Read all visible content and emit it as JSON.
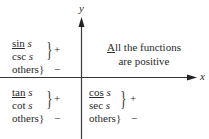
{
  "axes": {
    "x_label": "x",
    "y_label": "y"
  },
  "quadrants": {
    "q2": {
      "rows": [
        {
          "fn": "sin",
          "var": "s",
          "underline_first": true
        },
        {
          "fn": "csc",
          "var": "s"
        },
        {
          "fn": "others",
          "var": ""
        }
      ],
      "positive_sign": "+",
      "negative_sign": "−",
      "brace": "}"
    },
    "q1": {
      "line1_first_letter": "A",
      "line1_rest": "ll the functions",
      "line2": "are positive"
    },
    "q3": {
      "rows": [
        {
          "fn": "tan",
          "var": "s",
          "underline_first": true
        },
        {
          "fn": "cot",
          "var": "s"
        },
        {
          "fn": "others",
          "var": ""
        }
      ],
      "positive_sign": "+",
      "negative_sign": "−",
      "brace": "}"
    },
    "q4": {
      "rows": [
        {
          "fn": "cos",
          "var": "s",
          "underline_first": true
        },
        {
          "fn": "sec",
          "var": "s"
        },
        {
          "fn": "others",
          "var": ""
        }
      ],
      "positive_sign": "+",
      "negative_sign": "−",
      "brace": "}"
    }
  },
  "colors": {
    "ink": "#2a2a2a",
    "axis": "#3a3a3a",
    "background": "#ffffff"
  }
}
